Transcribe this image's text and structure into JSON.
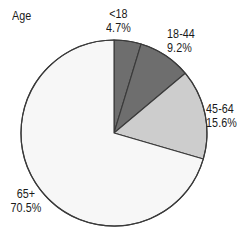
{
  "chart_title": "Age",
  "chart_data": {
    "type": "pie",
    "title": "Age",
    "xlabel": "",
    "ylabel": "",
    "legend_position": "none",
    "grid": false,
    "units": "percent",
    "start_angle_deg": 0,
    "direction": "clockwise",
    "categories": [
      "<18",
      "18-44",
      "45-64",
      "65+"
    ],
    "values": [
      4.7,
      9.2,
      15.6,
      70.5
    ],
    "value_labels": [
      "4.7%",
      "9.2%",
      "15.6%",
      "70.5%"
    ],
    "slice_colors": [
      "#6e6e6e",
      "#6e6e6e",
      "#cdcdcd",
      "#f7f7f7"
    ],
    "outline_color": "#3a3a3a",
    "slices": [
      {
        "label": "<18",
        "value": 4.7,
        "value_label": "4.7%",
        "color": "#6e6e6e",
        "start_deg": 0.0,
        "end_deg": 16.92
      },
      {
        "label": "18-44",
        "value": 9.2,
        "value_label": "9.2%",
        "color": "#6e6e6e",
        "start_deg": 16.92,
        "end_deg": 50.04
      },
      {
        "label": "45-64",
        "value": 15.6,
        "value_label": "15.6%",
        "color": "#cdcdcd",
        "start_deg": 50.04,
        "end_deg": 106.2
      },
      {
        "label": "65+",
        "value": 70.5,
        "value_label": "70.5%",
        "color": "#f7f7f7",
        "start_deg": 106.2,
        "end_deg": 360.0
      }
    ]
  },
  "labels": {
    "lt18": {
      "name": "<18",
      "pct": "4.7%"
    },
    "a18_44": {
      "name": "18-44",
      "pct": "9.2%"
    },
    "a45_64": {
      "name": "45-64",
      "pct": "15.6%"
    },
    "a65": {
      "name": "65+",
      "pct": "70.5%"
    }
  }
}
